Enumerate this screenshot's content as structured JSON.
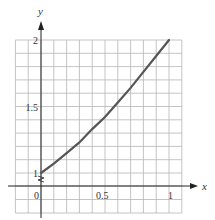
{
  "chart_data": {
    "type": "line",
    "title": "",
    "xlabel": "x",
    "ylabel": "y",
    "xlim": [
      -0.2,
      1.1
    ],
    "ylim": [
      0.9,
      2.0
    ],
    "grid": true,
    "grid_step": {
      "x": 0.1,
      "y": 0.1
    },
    "y_axis_break": true,
    "x_tick_labels": [
      "0",
      "0.5",
      "1"
    ],
    "x_ticks": [
      0,
      0.5,
      1
    ],
    "y_tick_labels": [
      "1",
      "1.5",
      "2"
    ],
    "y_ticks": [
      1,
      1.5,
      2
    ],
    "series": [
      {
        "name": "curve",
        "x": [
          0,
          0.1,
          0.2,
          0.3,
          0.4,
          0.5,
          0.6,
          0.7,
          0.8,
          0.9,
          1.0
        ],
        "values": [
          1.0,
          1.07,
          1.15,
          1.23,
          1.33,
          1.42,
          1.53,
          1.64,
          1.76,
          1.88,
          2.0
        ]
      }
    ],
    "legend": null
  },
  "colors": {
    "grid": "#b5b5b5",
    "axis": "#222222",
    "curve": "#555555",
    "text": "#333333"
  }
}
